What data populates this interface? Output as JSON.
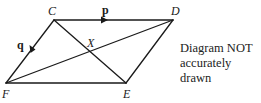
{
  "diagram": {
    "type": "parallelogram-vectors",
    "vertices": {
      "C": {
        "label": "C",
        "x": 54,
        "y": 20
      },
      "D": {
        "label": "D",
        "x": 173,
        "y": 20
      },
      "E": {
        "label": "E",
        "x": 126,
        "y": 83
      },
      "F": {
        "label": "F",
        "x": 6,
        "y": 83
      }
    },
    "intersection": {
      "label": "X"
    },
    "vectors": {
      "p": {
        "label": "p",
        "from": "C",
        "to": "D"
      },
      "q": {
        "label": "q",
        "from": "C",
        "to": "F"
      }
    },
    "segments": [
      "CD",
      "DE",
      "EF",
      "FC",
      "CE",
      "FD"
    ],
    "line_color": "#1a1a1a"
  },
  "note": {
    "line1": "Diagram NOT",
    "line2": "accurately drawn"
  }
}
